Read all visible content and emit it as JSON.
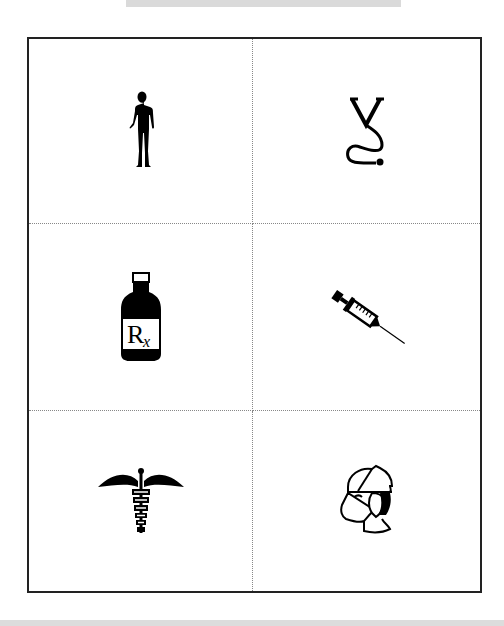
{
  "page": {
    "layout": "3x2 grid of medical clip-art cards with dotted cut lines",
    "colors": {
      "border": "#222222",
      "dotted_lines": "#888888",
      "icon_fill": "#000000",
      "top_bar": "#dadada",
      "bottom_bar": "#dcdcdc"
    }
  },
  "cards": [
    {
      "icon": "human-body-icon",
      "position": "row1-left"
    },
    {
      "icon": "stethoscope-icon",
      "position": "row1-right"
    },
    {
      "icon": "prescription-bottle-icon",
      "position": "row2-left",
      "label": "Rx"
    },
    {
      "icon": "syringe-icon",
      "position": "row2-right"
    },
    {
      "icon": "caduceus-icon",
      "position": "row3-left"
    },
    {
      "icon": "surgeon-mask-icon",
      "position": "row3-right"
    }
  ]
}
